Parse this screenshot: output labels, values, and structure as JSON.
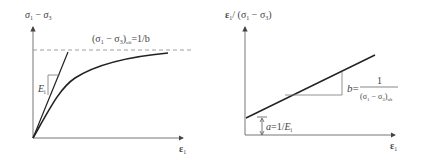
{
  "left_plot": {
    "y_label": {
      "sym1": "σ",
      "sub1": "1",
      "minus": " − ",
      "sym2": "σ",
      "sub2": "3"
    },
    "x_label": {
      "sym": "ε",
      "sub": "1"
    },
    "asymptote_label": {
      "open": "(σ",
      "sub1": "1",
      "minus": " − σ",
      "sub2": "3",
      "close": ")",
      "sub_ult": "ult",
      "eq": "=1/b"
    },
    "tangent_label": {
      "sym": "E",
      "sub": "i"
    }
  },
  "right_plot": {
    "y_label": {
      "sym": "ε",
      "sub": "1",
      "sep": "/ (σ",
      "sub1": "1",
      "minus": " − σ",
      "sub2": "3",
      "close": ")"
    },
    "x_label": {
      "sym": "ε",
      "sub": "1"
    },
    "slope_label": {
      "lhs": "b",
      "eq": "=",
      "num": "1",
      "den_open": "(σ",
      "den_sub1": "1",
      "den_minus": " − σ",
      "den_sub2": "3",
      "den_close": ")",
      "den_sub_ult": "ult"
    },
    "intercept_label": {
      "lhs": "a",
      "eq": "=1/",
      "sym": "E",
      "sub": "i"
    }
  },
  "colors": {
    "axis": "#555555",
    "curve": "#222222",
    "dashed": "#888888"
  }
}
